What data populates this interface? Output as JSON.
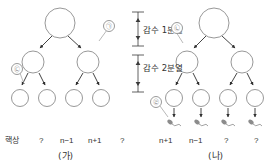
{
  "diagram": {
    "title_visible": false,
    "type": "meiosis-cell-lineage-diagram",
    "cases": [
      {
        "id": "case-ga",
        "label": "(가)"
      },
      {
        "id": "case-na",
        "label": "(나)"
      }
    ],
    "stage_labels": [
      {
        "id": "meiosis-1",
        "text": "감수 1분열"
      },
      {
        "id": "meiosis-2",
        "text": "감수 2분열"
      }
    ],
    "row_header": "핵상",
    "ploidy_ga": [
      "?",
      "n−1",
      "n+1",
      "?"
    ],
    "ploidy_na": [
      "n+1",
      "n−1",
      "?",
      "?"
    ],
    "markers": [
      {
        "id": "marker-a",
        "text": "㉠"
      },
      {
        "id": "marker-b",
        "text": "㉡"
      },
      {
        "id": "marker-c",
        "text": "㉢"
      },
      {
        "id": "marker-d",
        "text": "㉣"
      }
    ],
    "colors": {
      "stroke": "#8c8c8c",
      "arrow": "#2f2f2f",
      "text": "#333333",
      "background": "#ffffff"
    }
  }
}
